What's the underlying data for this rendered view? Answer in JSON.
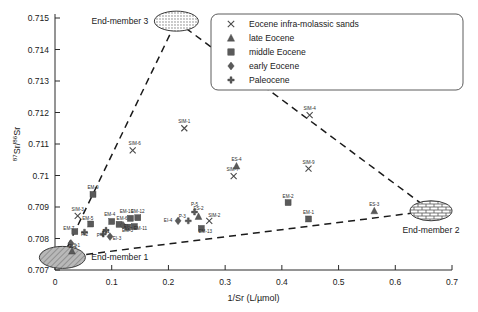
{
  "chart_data": {
    "type": "scatter",
    "title": "",
    "xlabel": "1/Sr (L/µmol)",
    "ylabel": "87Sr/86Sr",
    "ylabel_sup1": "87",
    "ylabel_mid": "Sr/",
    "ylabel_sup2": "86",
    "ylabel_end": "Sr",
    "xlim": [
      0,
      0.7
    ],
    "ylim": [
      0.707,
      0.715
    ],
    "xticks": [
      "0",
      "0.1",
      "0.2",
      "0.3",
      "0.4",
      "0.5",
      "0.6",
      "0.7"
    ],
    "xtick_values": [
      0,
      0.1,
      0.2,
      0.3,
      0.4,
      0.5,
      0.6,
      0.7
    ],
    "yticks": [
      "0.707",
      "0.708",
      "0.709",
      "0.71",
      "0.711",
      "0.712",
      "0.713",
      "0.714",
      "0.715"
    ],
    "ytick_values": [
      0.707,
      0.708,
      0.709,
      0.71,
      0.711,
      0.712,
      0.713,
      0.714,
      0.715
    ],
    "grid": false,
    "legend_position": "top-right",
    "legend": [
      {
        "marker": "x",
        "label": "Eocene infra-molassic sands"
      },
      {
        "marker": "triangle",
        "label": "late Eocene"
      },
      {
        "marker": "square",
        "label": "middle Eocene"
      },
      {
        "marker": "diamond",
        "label": "early Eocene"
      },
      {
        "marker": "plus",
        "label": "Paleocene"
      }
    ],
    "series": [
      {
        "name": "Eocene infra-molassic sands",
        "marker": "x",
        "points": [
          {
            "label": "SIM-1",
            "x": 0.228,
            "y": 0.7115,
            "lx": 0,
            "ly": -5
          },
          {
            "label": "SIM-6",
            "x": 0.137,
            "y": 0.7108,
            "lx": 2,
            "ly": -5
          },
          {
            "label": "SIM-4",
            "x": 0.449,
            "y": 0.71192,
            "lx": 0,
            "ly": -5
          },
          {
            "label": "SIM-9",
            "x": 0.447,
            "y": 0.71022,
            "lx": 0,
            "ly": -5
          },
          {
            "label": "SIM-7",
            "x": 0.315,
            "y": 0.70998,
            "lx": -1,
            "ly": -5
          },
          {
            "label": "SIM-3",
            "x": 0.04,
            "y": 0.70872,
            "lx": 0,
            "ly": -5
          },
          {
            "label": "SIM-2",
            "x": 0.272,
            "y": 0.70856,
            "lx": 5,
            "ly": -4
          }
        ]
      },
      {
        "name": "late Eocene",
        "marker": "triangle",
        "points": [
          {
            "label": "ES-4",
            "x": 0.32,
            "y": 0.7103,
            "lx": 0,
            "ly": -5
          },
          {
            "label": "ES-3",
            "x": 0.563,
            "y": 0.70888,
            "lx": 0,
            "ly": -5
          },
          {
            "label": "ES-2",
            "x": 0.253,
            "y": 0.7087,
            "lx": 0,
            "ly": -6
          },
          {
            "label": "ES-1",
            "x": 0.03,
            "y": 0.7076,
            "lx": 3,
            "ly": -4
          }
        ]
      },
      {
        "name": "middle Eocene",
        "marker": "square",
        "points": [
          {
            "label": "EM-9",
            "x": 0.067,
            "y": 0.7094,
            "lx": 0,
            "ly": -5
          },
          {
            "label": "EM-2",
            "x": 0.411,
            "y": 0.70914,
            "lx": 0,
            "ly": -5
          },
          {
            "label": "EM-1",
            "x": 0.447,
            "y": 0.70862,
            "lx": 0,
            "ly": -5
          },
          {
            "label": "EM-12",
            "x": 0.146,
            "y": 0.70866,
            "lx": 0,
            "ly": -5
          },
          {
            "label": "EM-10",
            "x": 0.133,
            "y": 0.70864,
            "lx": -4,
            "ly": -5
          },
          {
            "label": "EM-4",
            "x": 0.1,
            "y": 0.70854,
            "lx": -2,
            "ly": -5
          },
          {
            "label": "EM-5",
            "x": 0.063,
            "y": 0.70846,
            "lx": -3,
            "ly": -4
          },
          {
            "label": "EM-6",
            "x": 0.113,
            "y": 0.70845,
            "lx": 3,
            "ly": -4
          },
          {
            "label": "EM-7",
            "x": 0.035,
            "y": 0.70822,
            "lx": -6,
            "ly": -2
          },
          {
            "label": "EM-13",
            "x": 0.258,
            "y": 0.70832,
            "lx": 4,
            "ly": 5
          },
          {
            "label": "EM-3",
            "x": 0.128,
            "y": 0.70836,
            "lx": 0,
            "ly": 5
          },
          {
            "label": "EM-11",
            "x": 0.14,
            "y": 0.70838,
            "lx": 6,
            "ly": 3
          }
        ]
      },
      {
        "name": "early Eocene",
        "marker": "diamond",
        "points": [
          {
            "label": "EI-4",
            "x": 0.217,
            "y": 0.70856,
            "lx": -10,
            "ly": 1
          },
          {
            "label": "EI-1",
            "x": 0.12,
            "y": 0.70842,
            "lx": 5,
            "ly": 3
          },
          {
            "label": "EI-3",
            "x": 0.097,
            "y": 0.70806,
            "lx": 7,
            "ly": 3
          },
          {
            "label": "EI-2",
            "x": 0.028,
            "y": 0.70785,
            "lx": 2,
            "ly": 5
          }
        ]
      },
      {
        "name": "Paleocene",
        "marker": "plus",
        "points": [
          {
            "label": "P-5",
            "x": 0.246,
            "y": 0.70884,
            "lx": 0,
            "ly": -6
          },
          {
            "label": "P-3",
            "x": 0.235,
            "y": 0.70856,
            "lx": -6,
            "ly": -3
          },
          {
            "label": "P-2",
            "x": 0.052,
            "y": 0.7082,
            "lx": 0,
            "ly": 4
          },
          {
            "label": "P-4",
            "x": 0.085,
            "y": 0.70814,
            "lx": -3,
            "ly": 3
          },
          {
            "label": "P-1",
            "x": 0.09,
            "y": 0.70826,
            "lx": 0,
            "ly": 3
          }
        ]
      }
    ],
    "end_members": [
      {
        "name": "End-member 1",
        "x": 0.013,
        "y": 0.7074,
        "rx": 23,
        "ry": 11,
        "texture": "diagonal-hatch",
        "label_side": "right"
      },
      {
        "name": "End-member 2",
        "x": 0.663,
        "y": 0.70888,
        "rx": 21,
        "ry": 10,
        "texture": "brick",
        "label_side": "below"
      },
      {
        "name": "End-member 3",
        "x": 0.214,
        "y": 0.7149,
        "rx": 22,
        "ry": 10,
        "texture": "stipple",
        "label_side": "left"
      }
    ],
    "mixing_lines": [
      {
        "from": "End-member 1",
        "to": "End-member 3"
      },
      {
        "from": "End-member 3",
        "to": "End-member 2"
      },
      {
        "from": "End-member 1",
        "to": "End-member 2"
      }
    ],
    "colors": {
      "marker": "#5a5a5a",
      "line": "#1a1a1a",
      "axis": "#2b2b2b",
      "background": "#ffffff"
    }
  }
}
